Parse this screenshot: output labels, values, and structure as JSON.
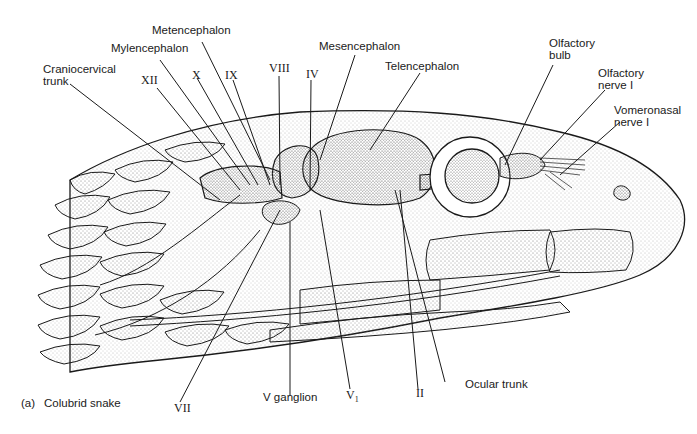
{
  "figure": {
    "panel": "(a)",
    "caption": "Colubrid snake"
  },
  "labels": {
    "metencephalon": "Metencephalon",
    "mylencephalon": "Mylencephalon",
    "craniocervical_trunk_1": "Craniocervical",
    "craniocervical_trunk_2": "trunk",
    "xii": "XII",
    "x": "X",
    "ix": "IX",
    "viii": "VIII",
    "iv": "IV",
    "mesencephalon": "Mesencephalon",
    "telencephalon": "Telencephalon",
    "olfactory_bulb_1": "Olfactory",
    "olfactory_bulb_2": "bulb",
    "olfactory_nerve_1": "Olfactory",
    "olfactory_nerve_2": "nerve I",
    "vomeronasal_nerve_1": "Vomeronasal",
    "vomeronasal_nerve_2": "nerve I",
    "vii": "VII",
    "v_ganglion": "V ganglion",
    "v1": "V",
    "v1_sub": "1",
    "ii": "II",
    "ocular_trunk": "Ocular trunk"
  },
  "colors": {
    "ink": "#1a1a1a",
    "stipple": "#9a9a9a",
    "background": "#ffffff"
  }
}
